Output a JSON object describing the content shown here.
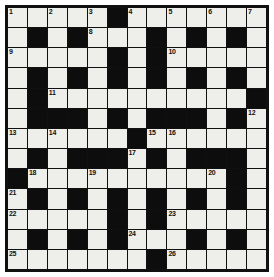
{
  "puzzle": {
    "title": "Crossword Grid",
    "type": "crossword",
    "rows": 13,
    "cols": 13,
    "colors": {
      "block": "#0d0d0d",
      "open": "#eeeeea",
      "border": "#101010",
      "number": "#111111",
      "background": "#ffffff"
    },
    "legend": {
      "block_symbol": "#",
      "open_symbol": "."
    },
    "grid": [
      ".....#.......",
      ".#.#...#.#.#.",
      ".....#.#.....",
      ".#.#.#.#.#.#.",
      ".#..........#",
      ".###.#.###.#.",
      "......#......",
      ".#.###.#.###.",
      "#..........#.",
      ".#.#.#.#.#.#.",
      ".....#.#.....",
      ".#.#.#...#.#.",
      ".......#....."
    ],
    "numbers": [
      {
        "n": 1,
        "row": 0,
        "col": 0
      },
      {
        "n": 2,
        "row": 0,
        "col": 2
      },
      {
        "n": 3,
        "row": 0,
        "col": 4
      },
      {
        "n": 4,
        "row": 0,
        "col": 6
      },
      {
        "n": 5,
        "row": 0,
        "col": 8
      },
      {
        "n": 6,
        "row": 0,
        "col": 10
      },
      {
        "n": 7,
        "row": 0,
        "col": 12
      },
      {
        "n": 8,
        "row": 1,
        "col": 4
      },
      {
        "n": 9,
        "row": 2,
        "col": 0
      },
      {
        "n": 10,
        "row": 2,
        "col": 8
      },
      {
        "n": 11,
        "row": 4,
        "col": 2
      },
      {
        "n": 12,
        "row": 5,
        "col": 12
      },
      {
        "n": 13,
        "row": 6,
        "col": 0
      },
      {
        "n": 14,
        "row": 6,
        "col": 2
      },
      {
        "n": 15,
        "row": 6,
        "col": 7
      },
      {
        "n": 16,
        "row": 6,
        "col": 8
      },
      {
        "n": 17,
        "row": 7,
        "col": 6
      },
      {
        "n": 18,
        "row": 8,
        "col": 1
      },
      {
        "n": 19,
        "row": 8,
        "col": 4
      },
      {
        "n": 20,
        "row": 8,
        "col": 10
      },
      {
        "n": 21,
        "row": 9,
        "col": 0
      },
      {
        "n": 22,
        "row": 10,
        "col": 0
      },
      {
        "n": 23,
        "row": 10,
        "col": 8
      },
      {
        "n": 24,
        "row": 11,
        "col": 6
      },
      {
        "n": 25,
        "row": 12,
        "col": 0
      },
      {
        "n": 26,
        "row": 12,
        "col": 8
      }
    ],
    "letters": []
  }
}
